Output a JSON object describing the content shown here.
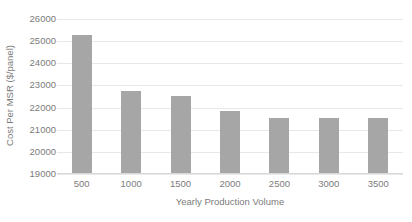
{
  "chart_data": {
    "type": "bar",
    "title": "",
    "xlabel": "Yearly Production Volume",
    "ylabel": "Cost Per MSR ($/panel)",
    "categories": [
      "500",
      "1000",
      "1500",
      "2000",
      "2500",
      "3000",
      "3500"
    ],
    "values": [
      25300,
      22770,
      22520,
      21830,
      21540,
      21540,
      21520
    ],
    "series": [
      {
        "name": "Cost Per MSR ($/panel)",
        "values": [
          25300,
          22770,
          22520,
          21830,
          21540,
          21540,
          21520
        ]
      }
    ],
    "ylim": [
      19000,
      26000
    ],
    "ytick_labels": [
      "26000",
      "25000",
      "24000",
      "23000",
      "22000",
      "21000",
      "20000",
      "19000"
    ],
    "ytick_values": [
      26000,
      25000,
      24000,
      23000,
      22000,
      21000,
      20000,
      19000
    ],
    "ystep": 1000,
    "grid": true,
    "grid_axis": "y",
    "legend": false,
    "legend_position": "none",
    "bar_color": "#a6a6a6",
    "gridline_color": "#e8e8e8",
    "text_color": "#7b7b7b",
    "background_color": "#ffffff"
  }
}
